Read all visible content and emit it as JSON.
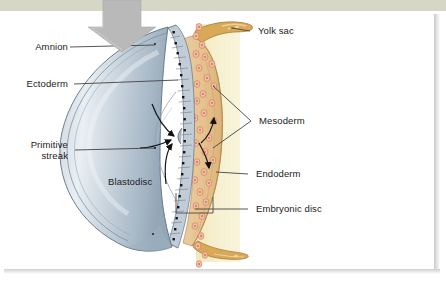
{
  "figure": {
    "type": "anatomical-illustration",
    "background_color": "#ffffff",
    "top_band_color": "#d6d7c4"
  },
  "labels": {
    "amnion": "Amnion",
    "ectoderm": "Ectoderm",
    "primitive_streak_line1": "Primitive",
    "primitive_streak_line2": "streak",
    "blastodisc": "Blastodisc",
    "yolk_sac": "Yolk sac",
    "mesoderm": "Mesoderm",
    "endoderm": "Endoderm",
    "embryonic_disc": "Embryonic disc"
  },
  "colors": {
    "blastodisc_fill": "#c3ced8",
    "blastodisc_highlight": "#e6ecf1",
    "blastodisc_shadow": "#8fa2b3",
    "ectoderm_cell": "#b9c5d2",
    "ectoderm_nucleus": "#1d1d1d",
    "mesoderm_cell": "#f0b8a2",
    "mesoderm_nucleus": "#c56a4d",
    "endoderm_tissue": "#e4c391",
    "yolk_fill": "#f6efc9",
    "yolk_membrane": "#c99b4a",
    "arrow_grey": "#b4b4b4",
    "leader_line": "#444444",
    "text": "#1b1b1b"
  },
  "annotations": {
    "pressure_arrow": "large grey downward arrow",
    "migration_arrows": "curved black arrows converging on the primitive streak",
    "mesoderm_arrows": "black arrowheads indicating cells migrating up and down between layers"
  }
}
